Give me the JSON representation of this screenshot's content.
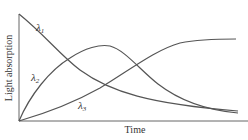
{
  "figure": {
    "y_axis_label": "Light absorption",
    "x_axis_label": "Time",
    "curves": [
      {
        "name": "lambda-1",
        "label": "λ",
        "subscript": "1",
        "description": "decays from high to low"
      },
      {
        "name": "lambda-2",
        "label": "λ",
        "subscript": "2",
        "description": "rises to a peak then decays"
      },
      {
        "name": "lambda-3",
        "label": "λ",
        "subscript": "3",
        "description": "rises sigmoidally to plateau"
      }
    ],
    "line_color": "#555555",
    "axis_color": "#666666"
  }
}
